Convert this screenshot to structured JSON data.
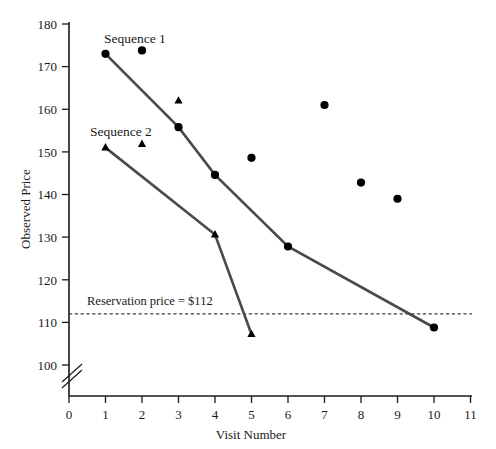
{
  "chart_data": {
    "type": "line",
    "title": "",
    "subtitle": "",
    "xlabel": "Visit Number",
    "ylabel": "Observed Price",
    "xlim": [
      0,
      11
    ],
    "ylim": [
      95,
      180
    ],
    "y_axis_break": true,
    "y_axis_break_note": "axis broken below 100",
    "grid": false,
    "legend_position": "inline-annotations",
    "xticks": [
      0,
      1,
      2,
      3,
      4,
      5,
      6,
      7,
      8,
      9,
      10,
      11
    ],
    "xtick_labels": [
      "0",
      "1",
      "2",
      "3",
      "4",
      "5",
      "6",
      "7",
      "8",
      "9",
      "10",
      "11"
    ],
    "yticks": [
      100,
      110,
      120,
      130,
      140,
      150,
      160,
      170,
      180
    ],
    "ytick_labels": [
      "100",
      "110",
      "120",
      "130",
      "140",
      "150",
      "160",
      "170",
      "180"
    ],
    "series": [
      {
        "name": "Sequence 1",
        "label": "Sequence 1",
        "marker": "circle",
        "connected": true,
        "color": "#4a4a4a",
        "marker_color": "#000000",
        "x": [
          1,
          3,
          4,
          6,
          10
        ],
        "values": [
          173.0,
          155.8,
          144.6,
          127.8,
          108.8
        ]
      },
      {
        "name": "Sequence 2",
        "label": "Sequence 2",
        "marker": "triangle",
        "connected": true,
        "color": "#4a4a4a",
        "marker_color": "#000000",
        "x": [
          1,
          4,
          5
        ],
        "values": [
          151.0,
          130.6,
          107.2
        ]
      },
      {
        "name": "Unconnected circles",
        "label": "",
        "marker": "circle",
        "connected": false,
        "marker_color": "#000000",
        "x": [
          2,
          5,
          7,
          8,
          9
        ],
        "values": [
          173.8,
          148.6,
          161.0,
          142.8,
          139.0
        ]
      },
      {
        "name": "Unconnected triangles",
        "label": "",
        "marker": "triangle",
        "connected": false,
        "marker_color": "#000000",
        "x": [
          2,
          3
        ],
        "values": [
          151.8,
          162.0
        ]
      }
    ],
    "annotations": [
      {
        "name": "reservation-price",
        "text": "Reservation price = $112",
        "value": 112,
        "style": "dashed horizontal line"
      }
    ],
    "series_labels": [
      {
        "name": "sequence-1-label",
        "text": "Sequence 1"
      },
      {
        "name": "sequence-2-label",
        "text": "Sequence 2"
      }
    ]
  },
  "colors": {
    "line": "#4a4a4a",
    "marker": "#000000",
    "axis": "#1a1a1a",
    "reference_line": "#3d3d3d",
    "background": "#ffffff"
  }
}
